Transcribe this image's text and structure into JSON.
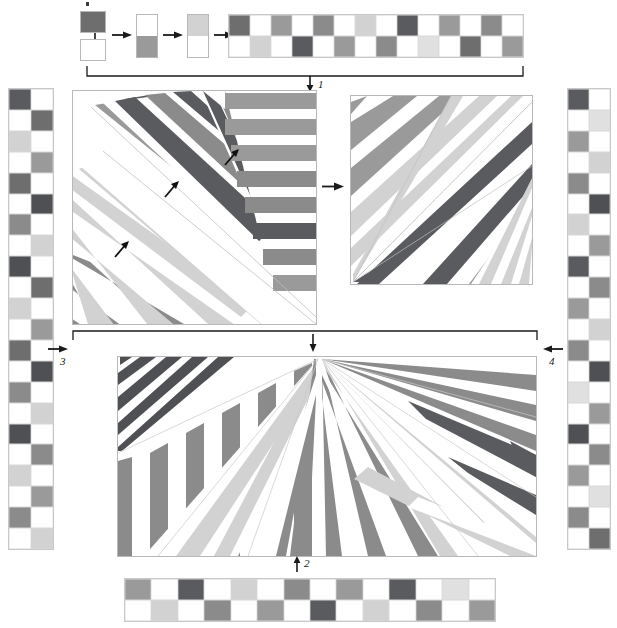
{
  "figure": {
    "background": "#ffffff"
  },
  "palette": {
    "white": "#ffffff",
    "light_gray": "#d2d2d2",
    "mid_gray": "#9a9a9a",
    "dark_gray": "#6e6e6e",
    "darkest_gray": "#4f5054",
    "outline": "#b8b8b8",
    "ink": "#1a1a1a"
  },
  "step_labels": [
    {
      "id": "1",
      "text": "1",
      "arrow": "down-arrow"
    },
    {
      "id": "2",
      "text": "2",
      "arrow": "up-arrow"
    },
    {
      "id": "3",
      "text": "3",
      "arrow": "right-arrow"
    },
    {
      "id": "4",
      "text": "4",
      "arrow": "left-arrow"
    }
  ],
  "construction": {
    "seed_top_color": "#6e6e6e",
    "seed_bottom_color": "#ffffff",
    "arrow_glyph": "right-arrow",
    "stages": [
      {
        "name": "seed-pair",
        "cells": [
          "#6e6e6e",
          "#ffffff"
        ]
      },
      {
        "name": "stage-1",
        "cells": [
          "#ffffff",
          "#9a9a9a"
        ]
      },
      {
        "name": "stage-2",
        "cells": [
          "#d2d2d2",
          "#ffffff"
        ]
      },
      {
        "name": "stage-3",
        "cells": [
          "#ffffff",
          "#9a9a9a"
        ]
      },
      {
        "name": "stage-4",
        "columns": 4,
        "cells": [
          "#6e6e6e",
          "#ffffff",
          "#9a9a9a",
          "#ffffff",
          "#ffffff",
          "#d2d2d2",
          "#ffffff",
          "#6e6e6e"
        ]
      }
    ]
  },
  "strips": {
    "top": {
      "name": "top-checker-strip",
      "columns": 14,
      "rows": 2,
      "cells": [
        "#6e6e6e",
        "#ffffff",
        "#9a9a9a",
        "#ffffff",
        "#8b8b8b",
        "#ffffff",
        "#d2d2d2",
        "#ffffff",
        "#5a5b5f",
        "#ffffff",
        "#9a9a9a",
        "#ffffff",
        "#8b8b8b",
        "#ffffff",
        "#ffffff",
        "#d2d2d2",
        "#ffffff",
        "#5a5b5f",
        "#ffffff",
        "#9a9a9a",
        "#ffffff",
        "#8b8b8b",
        "#ffffff",
        "#e0e0e0",
        "#ffffff",
        "#6e6e6e",
        "#ffffff",
        "#9a9a9a"
      ]
    },
    "bottom": {
      "name": "bottom-checker-strip",
      "columns": 14,
      "rows": 2,
      "cells": [
        "#9a9a9a",
        "#ffffff",
        "#5a5b5f",
        "#ffffff",
        "#d2d2d2",
        "#ffffff",
        "#8b8b8b",
        "#ffffff",
        "#9a9a9a",
        "#ffffff",
        "#5a5b5f",
        "#ffffff",
        "#e0e0e0",
        "#ffffff",
        "#ffffff",
        "#d2d2d2",
        "#ffffff",
        "#8b8b8b",
        "#ffffff",
        "#9a9a9a",
        "#ffffff",
        "#5a5b5f",
        "#ffffff",
        "#d2d2d2",
        "#ffffff",
        "#8b8b8b",
        "#ffffff",
        "#9a9a9a"
      ]
    },
    "bottom_tail": {
      "name": "bottom-checker-strip-tail",
      "cells": [
        "#8b8b8b",
        "#ffffff",
        "#5a5b5f",
        "#ffffff",
        "#e0e0e0",
        "#ffffff"
      ]
    },
    "left": {
      "name": "left-checker-strip",
      "columns": 2,
      "rows": 22,
      "cells": [
        "#5a5b5f",
        "#ffffff",
        "#ffffff",
        "#6e6e6e",
        "#d2d2d2",
        "#ffffff",
        "#ffffff",
        "#9a9a9a",
        "#6e6e6e",
        "#ffffff",
        "#ffffff",
        "#4f5054",
        "#8b8b8b",
        "#ffffff",
        "#ffffff",
        "#d2d2d2",
        "#4f5054",
        "#ffffff",
        "#ffffff",
        "#6e6e6e",
        "#d2d2d2",
        "#ffffff",
        "#ffffff",
        "#9a9a9a",
        "#6e6e6e",
        "#ffffff",
        "#ffffff",
        "#4f5054",
        "#8b8b8b",
        "#ffffff",
        "#ffffff",
        "#d2d2d2",
        "#4f5054",
        "#ffffff",
        "#ffffff",
        "#8b8b8b",
        "#d2d2d2",
        "#ffffff",
        "#ffffff",
        "#9a9a9a",
        "#8b8b8b",
        "#ffffff",
        "#ffffff",
        "#d2d2d2"
      ]
    },
    "right": {
      "name": "right-checker-strip",
      "columns": 2,
      "rows": 22,
      "cells": [
        "#5a5b5f",
        "#ffffff",
        "#ffffff",
        "#e0e0e0",
        "#9a9a9a",
        "#ffffff",
        "#ffffff",
        "#d2d2d2",
        "#8b8b8b",
        "#ffffff",
        "#ffffff",
        "#4f5054",
        "#d2d2d2",
        "#ffffff",
        "#ffffff",
        "#9a9a9a",
        "#5a5b5f",
        "#ffffff",
        "#ffffff",
        "#8b8b8b",
        "#9a9a9a",
        "#ffffff",
        "#ffffff",
        "#d2d2d2",
        "#8b8b8b",
        "#ffffff",
        "#ffffff",
        "#4f5054",
        "#e0e0e0",
        "#ffffff",
        "#ffffff",
        "#9a9a9a",
        "#4f5054",
        "#ffffff",
        "#ffffff",
        "#8b8b8b",
        "#9a9a9a",
        "#ffffff",
        "#ffffff",
        "#e0e0e0",
        "#8b8b8b",
        "#ffffff",
        "#ffffff",
        "#6e6e6e"
      ]
    }
  },
  "panels": {
    "upper_left": {
      "name": "upper-left-fan-panel",
      "description": "Radial fan of striped wedges emanating toward lower-left",
      "annotations": [
        {
          "name": "fan-arrow-a",
          "x": 120,
          "y": 245,
          "rotation": -45
        },
        {
          "name": "fan-arrow-b",
          "x": 170,
          "y": 185,
          "rotation": -45
        },
        {
          "name": "fan-arrow-c",
          "x": 230,
          "y": 155,
          "rotation": -45
        }
      ]
    },
    "upper_right": {
      "name": "upper-right-fan-panel",
      "description": "Square panel with diagonal striped bands converging at lower-left corner"
    },
    "bottom": {
      "name": "bottom-fan-panel",
      "description": "Wide panel with two fans converging at top-center apex"
    }
  },
  "flow_arrows": [
    {
      "name": "flow-arrow-upper-mid",
      "direction": "right"
    },
    {
      "name": "flow-arrow-step-1",
      "direction": "down"
    },
    {
      "name": "flow-arrow-step-2",
      "direction": "up"
    },
    {
      "name": "flow-arrow-step-3",
      "direction": "right"
    },
    {
      "name": "flow-arrow-step-4",
      "direction": "left"
    }
  ]
}
